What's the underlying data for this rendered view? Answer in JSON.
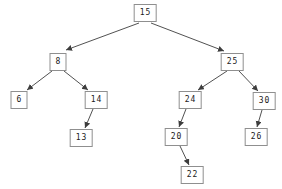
{
  "diagram": {
    "type": "binary-search-tree",
    "nodes": [
      {
        "id": "15",
        "label": "15"
      },
      {
        "id": "8",
        "label": "8"
      },
      {
        "id": "25",
        "label": "25"
      },
      {
        "id": "6",
        "label": "6"
      },
      {
        "id": "14",
        "label": "14"
      },
      {
        "id": "24",
        "label": "24"
      },
      {
        "id": "30",
        "label": "30"
      },
      {
        "id": "13",
        "label": "13"
      },
      {
        "id": "20",
        "label": "20"
      },
      {
        "id": "26",
        "label": "26"
      },
      {
        "id": "22",
        "label": "22"
      }
    ],
    "edges": [
      {
        "from": "15",
        "to": "8"
      },
      {
        "from": "15",
        "to": "25"
      },
      {
        "from": "8",
        "to": "6"
      },
      {
        "from": "8",
        "to": "14"
      },
      {
        "from": "14",
        "to": "13"
      },
      {
        "from": "25",
        "to": "24"
      },
      {
        "from": "25",
        "to": "30"
      },
      {
        "from": "24",
        "to": "20"
      },
      {
        "from": "20",
        "to": "22"
      },
      {
        "from": "30",
        "to": "26"
      }
    ],
    "colors": {
      "background": "#ffffff",
      "node_fill": "#ffffff",
      "node_border": "#8f8f8f",
      "edge": "#3d3d3d",
      "text": "#1a1a1a"
    }
  }
}
